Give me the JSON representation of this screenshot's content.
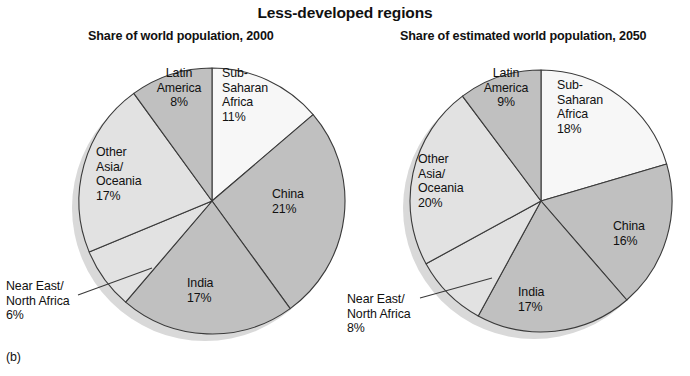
{
  "figure": {
    "title": "Less-developed regions",
    "panel_label": "(b)"
  },
  "colors": {
    "lightest": "#f7f7f7",
    "light": "#e2e2e2",
    "medium": "#c0c0c0",
    "shadow": "#d9d9d9",
    "outline": "#3a3a3a",
    "text": "#111111",
    "background": "#ffffff"
  },
  "chart_data": [
    {
      "type": "pie",
      "id": "pie-2000",
      "title": "Share of world population, 2000",
      "unit": "percent of world population",
      "start_angle_deg": 0,
      "direction": "clockwise",
      "categories": [
        "Sub-Saharan Africa",
        "China",
        "India",
        "Near East/North Africa",
        "Other Asia/Oceania",
        "Latin America"
      ],
      "values": [
        11,
        21,
        17,
        6,
        17,
        8
      ],
      "labels": [
        {
          "name": "Sub-Saharan Africa",
          "text": "Sub-\nSaharan\nAfrica",
          "value": 11,
          "value_text": "11%",
          "fill": "#f7f7f7",
          "placement": "inside"
        },
        {
          "name": "China",
          "text": "China",
          "value": 21,
          "value_text": "21%",
          "fill": "#c0c0c0",
          "placement": "inside"
        },
        {
          "name": "India",
          "text": "India",
          "value": 17,
          "value_text": "17%",
          "fill": "#c0c0c0",
          "placement": "inside"
        },
        {
          "name": "Near East/North Africa",
          "text": "Near East/\nNorth Africa",
          "value": 6,
          "value_text": "6%",
          "fill": "#e2e2e2",
          "placement": "outside-leader"
        },
        {
          "name": "Other Asia/Oceania",
          "text": "Other\nAsia/\nOceania",
          "value": 17,
          "value_text": "17%",
          "fill": "#e2e2e2",
          "placement": "inside"
        },
        {
          "name": "Latin America",
          "text": "Latin\nAmerica",
          "value": 8,
          "value_text": "8%",
          "fill": "#c0c0c0",
          "placement": "inside"
        }
      ]
    },
    {
      "type": "pie",
      "id": "pie-2050",
      "title": "Share of estimated world population, 2050",
      "unit": "percent of estimated world population",
      "start_angle_deg": 0,
      "direction": "clockwise",
      "categories": [
        "Sub-Saharan Africa",
        "China",
        "India",
        "Near East/North Africa",
        "Other Asia/Oceania",
        "Latin America"
      ],
      "values": [
        18,
        16,
        17,
        8,
        20,
        9
      ],
      "labels": [
        {
          "name": "Sub-Saharan Africa",
          "text": "Sub-\nSaharan\nAfrica",
          "value": 18,
          "value_text": "18%",
          "fill": "#f7f7f7",
          "placement": "inside"
        },
        {
          "name": "China",
          "text": "China",
          "value": 16,
          "value_text": "16%",
          "fill": "#c0c0c0",
          "placement": "inside"
        },
        {
          "name": "India",
          "text": "India",
          "value": 17,
          "value_text": "17%",
          "fill": "#c0c0c0",
          "placement": "inside"
        },
        {
          "name": "Near East/North Africa",
          "text": "Near East/\nNorth Africa",
          "value": 8,
          "value_text": "8%",
          "fill": "#e2e2e2",
          "placement": "outside-leader"
        },
        {
          "name": "Other Asia/Oceania",
          "text": "Other\nAsia/\nOceania",
          "value": 20,
          "value_text": "20%",
          "fill": "#e2e2e2",
          "placement": "inside"
        },
        {
          "name": "Latin America",
          "text": "Latin\nAmerica",
          "value": 9,
          "value_text": "9%",
          "fill": "#c0c0c0",
          "placement": "inside"
        }
      ]
    }
  ],
  "left_pie": {
    "title": "Share of world population, 2000",
    "slices": {
      "ssa": {
        "name": "Sub-Saharan Africa",
        "l1": "Sub-",
        "l2": "Saharan",
        "l3": "Africa",
        "pct": "11%"
      },
      "china": {
        "name": "China",
        "l1": "China",
        "pct": "21%"
      },
      "india": {
        "name": "India",
        "l1": "India",
        "pct": "17%"
      },
      "nena": {
        "name": "Near East/North Africa",
        "l1": "Near East/",
        "l2": "North Africa",
        "pct": "6%"
      },
      "asia": {
        "name": "Other Asia/Oceania",
        "l1": "Other",
        "l2": "Asia/",
        "l3": "Oceania",
        "pct": "17%"
      },
      "latam": {
        "name": "Latin America",
        "l1": "Latin",
        "l2": "America",
        "pct": "8%"
      }
    }
  },
  "right_pie": {
    "title": "Share of estimated world population, 2050",
    "slices": {
      "ssa": {
        "name": "Sub-Saharan Africa",
        "l1": "Sub-",
        "l2": "Saharan",
        "l3": "Africa",
        "pct": "18%"
      },
      "china": {
        "name": "China",
        "l1": "China",
        "pct": "16%"
      },
      "india": {
        "name": "India",
        "l1": "India",
        "pct": "17%"
      },
      "nena": {
        "name": "Near East/North Africa",
        "l1": "Near East/",
        "l2": "North Africa",
        "pct": "8%"
      },
      "asia": {
        "name": "Other Asia/Oceania",
        "l1": "Other",
        "l2": "Asia/",
        "l3": "Oceania",
        "pct": "20%"
      },
      "latam": {
        "name": "Latin America",
        "l1": "Latin",
        "l2": "America",
        "pct": "9%"
      }
    }
  }
}
